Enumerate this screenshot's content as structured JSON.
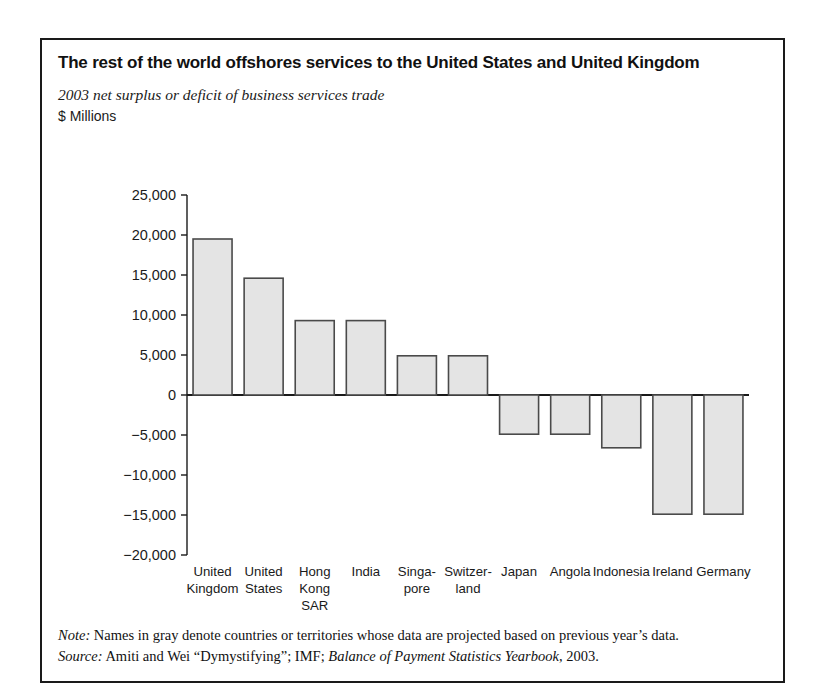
{
  "figure": {
    "title": "The rest of the world offshores services to the United States and United Kingdom",
    "subtitle": "2003 net surplus or deficit of business services trade",
    "units": "$ Millions",
    "note_label": "Note:",
    "note_text": " Names in gray denote countries or territories whose data are projected based on previous year’s data.",
    "source_label": "Source:",
    "source_text_a": " Amiti and Wei “Dymystifying”; IMF; ",
    "source_text_italic": "Balance of Payment Statistics Yearbook",
    "source_text_b": ", 2003."
  },
  "style": {
    "bar_fill": "#e4e4e4",
    "bar_stroke": "#4a4a4a",
    "axis_color": "#1a1a1a",
    "frame_color": "#1a1a1a",
    "tick_label_color": "#1a1a1a"
  },
  "chart_data": {
    "type": "bar",
    "title": "The rest of the world offshores services to the United States and United Kingdom",
    "subtitle": "2003 net surplus or deficit of business services trade",
    "xlabel": "",
    "ylabel": "$ Millions",
    "ylim": [
      -20000,
      25000
    ],
    "ytick_step": 5000,
    "grid": false,
    "legend": "none",
    "categories": [
      "United Kingdom",
      "United States",
      "Hong Kong SAR",
      "India",
      "Singapore",
      "Switzerland",
      "Japan",
      "Angola",
      "Indonesia",
      "Ireland",
      "Germany"
    ],
    "category_label_lines": [
      [
        "United",
        "Kingdom"
      ],
      [
        "United",
        "States"
      ],
      [
        "Hong",
        "Kong",
        "SAR"
      ],
      [
        "India"
      ],
      [
        "Singa-",
        "pore"
      ],
      [
        "Switzer-",
        "land"
      ],
      [
        "Japan"
      ],
      [
        "Angola"
      ],
      [
        "Indonesia"
      ],
      [
        "Ireland"
      ],
      [
        "Germany"
      ]
    ],
    "values": [
      19500,
      14600,
      9300,
      9300,
      4900,
      4900,
      -4900,
      -4900,
      -6600,
      -14900,
      -14900
    ],
    "ytick_labels": [
      "25,000",
      "20,000",
      "15,000",
      "10,000",
      "5,000",
      "0",
      "−5,000",
      "−10,000",
      "−15,000",
      "−20,000"
    ],
    "ytick_values": [
      25000,
      20000,
      15000,
      10000,
      5000,
      0,
      -5000,
      -10000,
      -15000,
      -20000
    ]
  }
}
